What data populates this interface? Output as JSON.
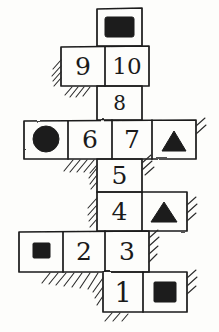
{
  "diagram": {
    "style": {
      "ink": "#1b1b1b",
      "paper": "#fdfdfb",
      "fill": "#1b1b1b",
      "stroke_width": 1.6
    },
    "grid": {
      "cell_width": 42,
      "cell_height": 40,
      "rows": 8
    },
    "cells": [
      {
        "id": "cell-top-rect",
        "label": "",
        "kind": "shape",
        "shape": "rectangle",
        "x": 97,
        "y": 8,
        "w": 45,
        "h": 38
      },
      {
        "id": "cell-9",
        "label": "9",
        "kind": "number",
        "shape": "",
        "x": 61,
        "y": 46,
        "w": 44,
        "h": 40
      },
      {
        "id": "cell-10",
        "label": "10",
        "kind": "number",
        "shape": "",
        "x": 105,
        "y": 46,
        "w": 44,
        "h": 40
      },
      {
        "id": "cell-8",
        "label": "8",
        "kind": "number",
        "shape": "",
        "x": 97,
        "y": 86,
        "w": 45,
        "h": 34
      },
      {
        "id": "cell-circle",
        "label": "",
        "kind": "shape",
        "shape": "circle",
        "x": 24,
        "y": 120,
        "w": 44,
        "h": 39
      },
      {
        "id": "cell-6",
        "label": "6",
        "kind": "number",
        "shape": "",
        "x": 68,
        "y": 120,
        "w": 44,
        "h": 39
      },
      {
        "id": "cell-7",
        "label": "7",
        "kind": "number",
        "shape": "",
        "x": 112,
        "y": 120,
        "w": 40,
        "h": 39
      },
      {
        "id": "cell-triangle-a",
        "label": "",
        "kind": "shape",
        "shape": "triangle",
        "x": 152,
        "y": 120,
        "w": 44,
        "h": 39
      },
      {
        "id": "cell-5",
        "label": "5",
        "kind": "number",
        "shape": "",
        "x": 97,
        "y": 159,
        "w": 45,
        "h": 33
      },
      {
        "id": "cell-4",
        "label": "4",
        "kind": "number",
        "shape": "",
        "x": 97,
        "y": 192,
        "w": 45,
        "h": 39
      },
      {
        "id": "cell-triangle-b",
        "label": "",
        "kind": "shape",
        "shape": "triangle",
        "x": 142,
        "y": 192,
        "w": 45,
        "h": 39
      },
      {
        "id": "cell-square-a",
        "label": "",
        "kind": "shape",
        "shape": "square",
        "x": 19,
        "y": 231,
        "w": 44,
        "h": 41
      },
      {
        "id": "cell-2",
        "label": "2",
        "kind": "number",
        "shape": "",
        "x": 63,
        "y": 231,
        "w": 42,
        "h": 41
      },
      {
        "id": "cell-3",
        "label": "3",
        "kind": "number",
        "shape": "",
        "x": 105,
        "y": 231,
        "w": 44,
        "h": 41
      },
      {
        "id": "cell-1",
        "label": "1",
        "kind": "number",
        "shape": "",
        "x": 103,
        "y": 272,
        "w": 40,
        "h": 40
      },
      {
        "id": "cell-square-b",
        "label": "",
        "kind": "shape",
        "shape": "square",
        "x": 143,
        "y": 272,
        "w": 44,
        "h": 40
      }
    ],
    "numbers_sequence": [
      "1",
      "2",
      "3",
      "4",
      "5",
      "6",
      "7",
      "8",
      "9",
      "10"
    ],
    "shape_glyphs": [
      "rectangle",
      "circle",
      "triangle",
      "triangle",
      "square",
      "square"
    ]
  }
}
